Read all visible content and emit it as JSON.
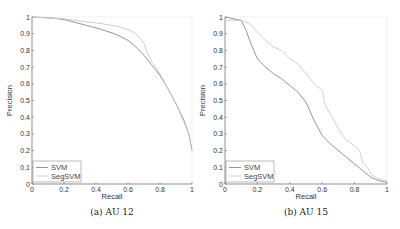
{
  "chart_data": [
    {
      "type": "line",
      "title": "",
      "caption": "(a) AU 12",
      "xlabel": "Recall",
      "ylabel": "Precision",
      "xlim": [
        0,
        1
      ],
      "ylim": [
        0,
        1
      ],
      "xticks": [
        "0",
        "0.2",
        "0.4",
        "0.6",
        "0.8",
        "1"
      ],
      "yticks": [
        "0",
        "0.1",
        "0.2",
        "0.3",
        "0.4",
        "0.5",
        "0.6",
        "0.7",
        "0.8",
        "0.9",
        "1"
      ],
      "grid": false,
      "legend_position": "lower left",
      "series": [
        {
          "name": "SVM",
          "color": "#8a8a8a",
          "x": [
            0,
            0.1,
            0.2,
            0.3,
            0.4,
            0.5,
            0.55,
            0.6,
            0.65,
            0.7,
            0.75,
            0.8,
            0.85,
            0.9,
            0.95,
            0.98,
            1.0
          ],
          "y": [
            1.0,
            0.995,
            0.985,
            0.96,
            0.935,
            0.905,
            0.885,
            0.86,
            0.82,
            0.77,
            0.71,
            0.65,
            0.57,
            0.48,
            0.38,
            0.3,
            0.2
          ]
        },
        {
          "name": "SegSVM",
          "color": "#c8c8c8",
          "x": [
            0,
            0.1,
            0.2,
            0.3,
            0.4,
            0.5,
            0.55,
            0.6,
            0.65,
            0.7,
            0.72,
            0.75,
            0.8,
            0.85,
            0.9,
            0.95,
            0.98,
            1.0
          ],
          "y": [
            1.0,
            0.995,
            0.99,
            0.975,
            0.965,
            0.95,
            0.94,
            0.925,
            0.9,
            0.84,
            0.79,
            0.73,
            0.66,
            0.57,
            0.48,
            0.37,
            0.3,
            0.2
          ]
        }
      ]
    },
    {
      "type": "line",
      "title": "",
      "caption": "(b) AU 15",
      "xlabel": "Recall",
      "ylabel": "Precision",
      "xlim": [
        0,
        1
      ],
      "ylim": [
        0,
        1
      ],
      "xticks": [
        "0",
        "0.2",
        "0.4",
        "0.6",
        "0.8",
        "1"
      ],
      "yticks": [
        "0",
        "0.1",
        "0.2",
        "0.3",
        "0.4",
        "0.5",
        "0.6",
        "0.7",
        "0.8",
        "0.9",
        "1"
      ],
      "grid": false,
      "legend_position": "lower left",
      "series": [
        {
          "name": "SVM",
          "color": "#8a8a8a",
          "x": [
            0,
            0.05,
            0.1,
            0.13,
            0.16,
            0.2,
            0.25,
            0.3,
            0.35,
            0.4,
            0.45,
            0.5,
            0.55,
            0.6,
            0.65,
            0.7,
            0.75,
            0.8,
            0.85,
            0.9,
            0.95,
            1.0
          ],
          "y": [
            1.0,
            0.99,
            0.98,
            0.92,
            0.84,
            0.75,
            0.7,
            0.66,
            0.63,
            0.59,
            0.55,
            0.49,
            0.38,
            0.29,
            0.24,
            0.2,
            0.16,
            0.12,
            0.08,
            0.04,
            0.02,
            0.01
          ]
        },
        {
          "name": "SegSVM",
          "color": "#c8c8c8",
          "x": [
            0,
            0.05,
            0.1,
            0.15,
            0.2,
            0.25,
            0.3,
            0.35,
            0.4,
            0.45,
            0.5,
            0.55,
            0.6,
            0.62,
            0.65,
            0.7,
            0.75,
            0.8,
            0.83,
            0.85,
            0.88,
            0.9,
            0.95,
            1.0
          ],
          "y": [
            0.98,
            0.98,
            0.98,
            0.96,
            0.91,
            0.86,
            0.82,
            0.8,
            0.75,
            0.72,
            0.66,
            0.6,
            0.56,
            0.47,
            0.42,
            0.33,
            0.26,
            0.23,
            0.2,
            0.13,
            0.1,
            0.06,
            0.03,
            0.02
          ]
        }
      ]
    }
  ]
}
